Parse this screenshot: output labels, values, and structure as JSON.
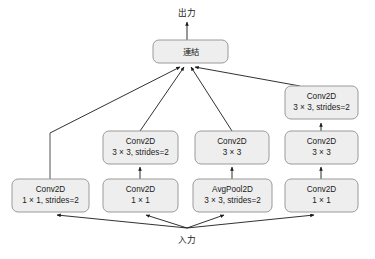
{
  "diagram": {
    "io": {
      "output_label": "出力",
      "input_label": "入力"
    },
    "concat": {
      "label": "連結"
    },
    "branches": [
      {
        "name": "branch-1",
        "nodes": [
          {
            "id": "b1-conv",
            "line1": "Conv2D",
            "line2": "1 × 1, strides=2"
          }
        ]
      },
      {
        "name": "branch-2",
        "nodes": [
          {
            "id": "b2-conv1",
            "line1": "Conv2D",
            "line2": "1 × 1"
          },
          {
            "id": "b2-conv2",
            "line1": "Conv2D",
            "line2": "3 × 3, strides=2"
          }
        ]
      },
      {
        "name": "branch-3",
        "nodes": [
          {
            "id": "b3-pool",
            "line1": "AvgPool2D",
            "line2": "3 × 3, strides=2"
          },
          {
            "id": "b3-conv",
            "line1": "Conv2D",
            "line2": "3 × 3"
          }
        ]
      },
      {
        "name": "branch-4",
        "nodes": [
          {
            "id": "b4-conv1",
            "line1": "Conv2D",
            "line2": "1 × 1"
          },
          {
            "id": "b4-conv2",
            "line1": "Conv2D",
            "line2": "3 × 3"
          },
          {
            "id": "b4-conv3",
            "line1": "Conv2D",
            "line2": "3 × 3, strides=2"
          }
        ]
      }
    ],
    "colors": {
      "box_fill": "#eeeeee",
      "box_stroke": "#9a9a9a",
      "edge": "#404040",
      "text": "#1a1a1a",
      "background": "#ffffff"
    }
  }
}
